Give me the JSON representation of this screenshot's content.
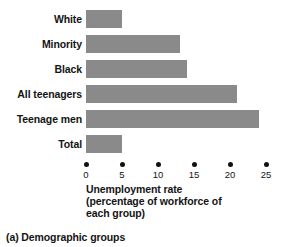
{
  "chart_data": {
    "type": "bar",
    "orientation": "horizontal",
    "title": "",
    "categories": [
      "White",
      "Minority",
      "Black",
      "All teenagers",
      "Teenage men",
      "Total"
    ],
    "values": [
      5,
      13,
      14,
      21,
      24,
      5
    ],
    "xlabel_lines": [
      "Unemployment rate",
      "(percentage of workforce of",
      "each group)"
    ],
    "xlabel": "Unemployment rate (percentage of workforce of each group)",
    "ylabel": "",
    "xlim": [
      0,
      26
    ],
    "xticks": [
      0,
      5,
      10,
      15,
      20,
      25
    ],
    "xtick_labels": [
      "0",
      "5",
      "10",
      "15",
      "20",
      "25"
    ],
    "grid": false,
    "legend": null,
    "bar_color": "#8a8a8a",
    "axis_color": "#111111",
    "text_color": "#141414"
  },
  "caption": "(a) Demographic groups"
}
